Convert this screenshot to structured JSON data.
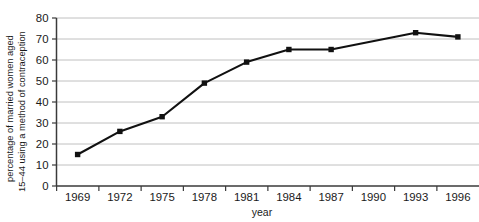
{
  "chart_data": {
    "type": "line",
    "title": "",
    "xlabel": "year",
    "ylabel": "percentage of married women aged 15–44 using a method of contraception",
    "ylabel_line1": "percentage of married women aged",
    "ylabel_line2": "15–44 using a method of contraception",
    "x": [
      1969,
      1972,
      1975,
      1978,
      1981,
      1984,
      1987,
      1993,
      1996
    ],
    "values": [
      15,
      26,
      33,
      49,
      59,
      65,
      65,
      73,
      71
    ],
    "xtick_labels": [
      "1969",
      "1972",
      "1975",
      "1978",
      "1981",
      "1984",
      "1987",
      "1990",
      "1993",
      "1996"
    ],
    "ytick_labels": [
      "0",
      "10",
      "20",
      "30",
      "40",
      "50",
      "60",
      "70",
      "80"
    ],
    "ytick_values": [
      0,
      10,
      20,
      30,
      40,
      50,
      60,
      70,
      80
    ],
    "ylim": [
      0,
      80
    ],
    "xlim": [
      1967.5,
      1997.5
    ],
    "grid": "horizontal",
    "legend": "none",
    "marker": "square",
    "line_color": "#111111",
    "marker_color": "#111111",
    "grid_color": "#b9b9b9",
    "axis_color": "#3a3a3a",
    "background_color": "#ffffff",
    "series": [
      {
        "name": "percentage using contraception",
        "points": [
          {
            "x": "1969",
            "y": 15
          },
          {
            "x": "1972",
            "y": 26
          },
          {
            "x": "1975",
            "y": 33
          },
          {
            "x": "1978",
            "y": 49
          },
          {
            "x": "1981",
            "y": 59
          },
          {
            "x": "1984",
            "y": 65
          },
          {
            "x": "1987",
            "y": 65
          },
          {
            "x": "1993",
            "y": 73
          },
          {
            "x": "1996",
            "y": 71
          }
        ]
      }
    ]
  }
}
